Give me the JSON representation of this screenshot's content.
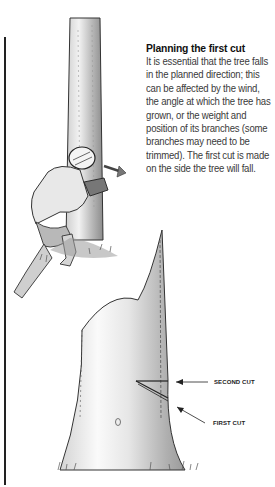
{
  "caption": {
    "title": "Planning the first cut",
    "body": "It is essential that the tree falls in the planned direction; this can be affected by the wind, the angle at which the tree has grown, or the weight and position of its branches (some branches may need to be trimmed). The first cut is made on the side the tree will fall."
  },
  "diagram": {
    "labels": {
      "second_cut": "SECOND CUT",
      "first_cut": "FIRST CUT"
    }
  },
  "illustrations": [
    "person-with-chainsaw-at-tree",
    "tree-trunk-with-cut-notch"
  ]
}
